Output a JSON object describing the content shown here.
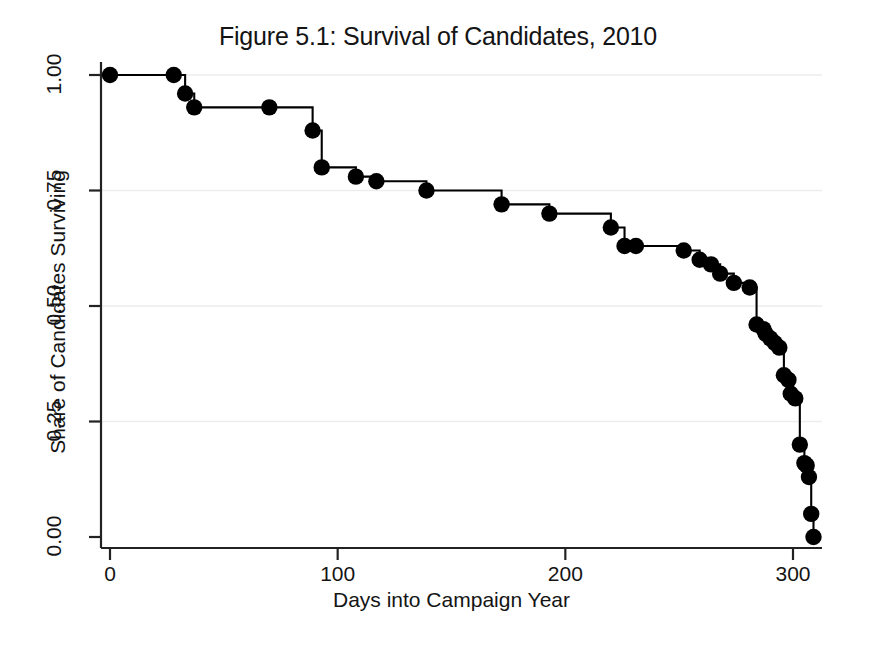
{
  "chart_data": {
    "type": "line",
    "subtype": "step-kaplan-meier",
    "title": "Figure 5.1: Survival of Candidates, 2010",
    "xlabel": "Days into Campaign Year",
    "ylabel": "Share of Candidates Surviving",
    "xlim": [
      -8,
      320
    ],
    "ylim": [
      0.0,
      1.02
    ],
    "xticks": [
      0,
      100,
      200,
      300
    ],
    "xtick_labels": [
      "0",
      "100",
      "200",
      "300"
    ],
    "yticks": [
      0.0,
      0.25,
      0.5,
      0.75,
      1.0
    ],
    "ytick_labels": [
      "0.00",
      "0.25",
      "0.50",
      "0.75",
      "1.00"
    ],
    "grid": "horizontal-faint",
    "legend": null,
    "line_color": "#000000",
    "marker_color": "#000000",
    "marker_shape": "circle",
    "background": "#ffffff",
    "x": [
      0,
      28,
      33,
      37,
      70,
      89,
      93,
      108,
      117,
      139,
      172,
      193,
      220,
      226,
      231,
      252,
      259,
      264,
      268,
      274,
      281,
      284,
      287,
      288,
      290,
      292,
      294,
      296,
      298,
      299,
      301,
      303,
      305,
      306,
      307,
      308,
      309
    ],
    "y": [
      1.0,
      1.0,
      0.96,
      0.93,
      0.93,
      0.88,
      0.8,
      0.78,
      0.77,
      0.75,
      0.72,
      0.7,
      0.67,
      0.63,
      0.63,
      0.62,
      0.6,
      0.59,
      0.57,
      0.55,
      0.54,
      0.46,
      0.45,
      0.44,
      0.43,
      0.42,
      0.41,
      0.35,
      0.34,
      0.31,
      0.3,
      0.2,
      0.16,
      0.155,
      0.13,
      0.05,
      0.0
    ],
    "series_name": "Share of Candidates Surviving"
  },
  "figure": {
    "title": "Figure 5.1: Survival of Candidates, 2010",
    "xlabel": "Days into Campaign Year",
    "ylabel": "Share of Candidates Surviving"
  }
}
